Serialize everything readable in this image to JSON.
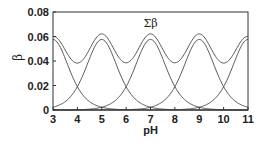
{
  "chart_data": {
    "type": "line",
    "title": "",
    "xlabel": "pH",
    "ylabel": "β",
    "xlim": [
      3,
      11
    ],
    "ylim": [
      0,
      0.08
    ],
    "x_ticks": [
      "3",
      "4",
      "5",
      "6",
      "7",
      "8",
      "9",
      "10",
      "11"
    ],
    "y_ticks": [
      "0",
      "0.02",
      "0.04",
      "0.06",
      "0.08"
    ],
    "grid": false,
    "legend": "none",
    "annotations": [
      {
        "text": "Σβ",
        "x": 7,
        "y": 0.071
      }
    ],
    "series": [
      {
        "name": "β (pKa 3)",
        "peak_x": 3,
        "x": [
          3,
          4,
          5,
          6,
          7
        ],
        "y": [
          0.0576,
          0.019,
          0.0023,
          0.0002,
          0.0
        ]
      },
      {
        "name": "β (pKa 5)",
        "peak_x": 5,
        "x": [
          3,
          4,
          5,
          6,
          7,
          8,
          9
        ],
        "y": [
          0.0023,
          0.019,
          0.0576,
          0.019,
          0.0023,
          0.0002,
          0.0
        ]
      },
      {
        "name": "β (pKa 7)",
        "peak_x": 7,
        "x": [
          5,
          6,
          7,
          8,
          9
        ],
        "y": [
          0.0023,
          0.019,
          0.0576,
          0.019,
          0.0023
        ]
      },
      {
        "name": "β (pKa 9)",
        "peak_x": 9,
        "x": [
          7,
          8,
          9,
          10,
          11
        ],
        "y": [
          0.0023,
          0.019,
          0.0576,
          0.019,
          0.0023
        ]
      },
      {
        "name": "β (pKa 11)",
        "peak_x": 11,
        "x": [
          7,
          8,
          9,
          10,
          11
        ],
        "y": [
          0.0,
          0.0002,
          0.0023,
          0.019,
          0.0576
        ]
      },
      {
        "name": "Σβ",
        "x": [
          3,
          4,
          5,
          6,
          7,
          8,
          9,
          10,
          11
        ],
        "y": [
          0.06,
          0.04,
          0.062,
          0.04,
          0.062,
          0.04,
          0.062,
          0.04,
          0.06
        ]
      }
    ],
    "component_concentration": 0.1,
    "component_pKa": [
      3,
      5,
      7,
      9,
      11
    ]
  },
  "labels": {
    "xlabel": "pH",
    "ylabel": "β",
    "sum_label": "Σβ"
  }
}
